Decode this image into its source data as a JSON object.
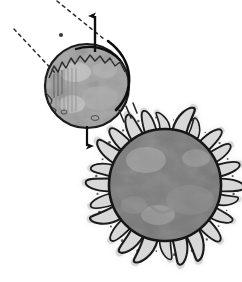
{
  "figure": {
    "description": "A smaller mottled sphere at upper left with vertical up and down arrows, a curved sweep arrow and two dashed trajectory lines, beside a larger mottled sphere at lower right surrounded by a radiating corona of hook-shaped spikes.",
    "background_color": "#ffffff",
    "ink_color": "#1a1a1a"
  },
  "objects": {
    "small_sphere": {
      "name": "small-sphere",
      "label": "small mottled sphere",
      "center_x": 87,
      "center_y": 86,
      "radius": 42,
      "fill_color": "#c9c9c9",
      "highlight_color": "#e2e2e2",
      "shadow_color": "#9a9a9a",
      "outline_color": "#1a1a1a",
      "outline_width": 2.2,
      "has_jagged_terminator": true,
      "has_left_hatching": true
    },
    "large_sphere": {
      "name": "large-sphere",
      "label": "large mottled sphere with corona",
      "center_x": 165,
      "center_y": 185,
      "radius": 57,
      "fill_color": "#ababab",
      "highlight_color": "#c4c4c4",
      "shadow_color": "#8d8d8d",
      "outline_color": "#151515",
      "outline_width": 2.6,
      "corona": {
        "name": "corona-spikes",
        "spike_count": 24,
        "spike_length": 22,
        "spike_fill": "#d6d6d6",
        "spike_stroke": "#1a1a1a",
        "halo_color": "#dcdcdc"
      }
    }
  },
  "annotations": {
    "arrow_up": {
      "name": "arrow-up",
      "label": "upward arrow",
      "x": 95,
      "y_tail": 52,
      "y_head": 12,
      "color": "#101010",
      "width": 2.4
    },
    "arrow_down": {
      "name": "arrow-down",
      "label": "downward arrow",
      "x": 87,
      "y_tail": 125,
      "y_head": 152,
      "color": "#101010",
      "width": 2.2
    },
    "sweep_arc": {
      "name": "sweep-arc",
      "label": "curved sweep arrow over sphere",
      "color": "#101010",
      "width": 2.6
    },
    "dashed_line_upper": {
      "name": "dashed-trajectory-upper",
      "label": "upper dashed trajectory line",
      "x1": 57,
      "y1": 1,
      "x2": 104,
      "y2": 39,
      "color": "#2b2b2b",
      "dash": "3 4",
      "width": 1.5
    },
    "dashed_line_lower": {
      "name": "dashed-trajectory-lower",
      "label": "lower dashed trajectory line",
      "x1": 14,
      "y1": 29,
      "x2": 56,
      "y2": 74,
      "color": "#2b2b2b",
      "dash": "3 4",
      "width": 1.5
    },
    "marker_dot": {
      "name": "marker-dot",
      "label": "small solid marker dot",
      "cx": 61,
      "cy": 35,
      "r": 2.1,
      "color": "#3a3a3a"
    },
    "tick_marks": {
      "name": "tick-marks",
      "label": "short tick strokes at lower right of small sphere",
      "color": "#2a2a2a",
      "count": 3
    }
  }
}
